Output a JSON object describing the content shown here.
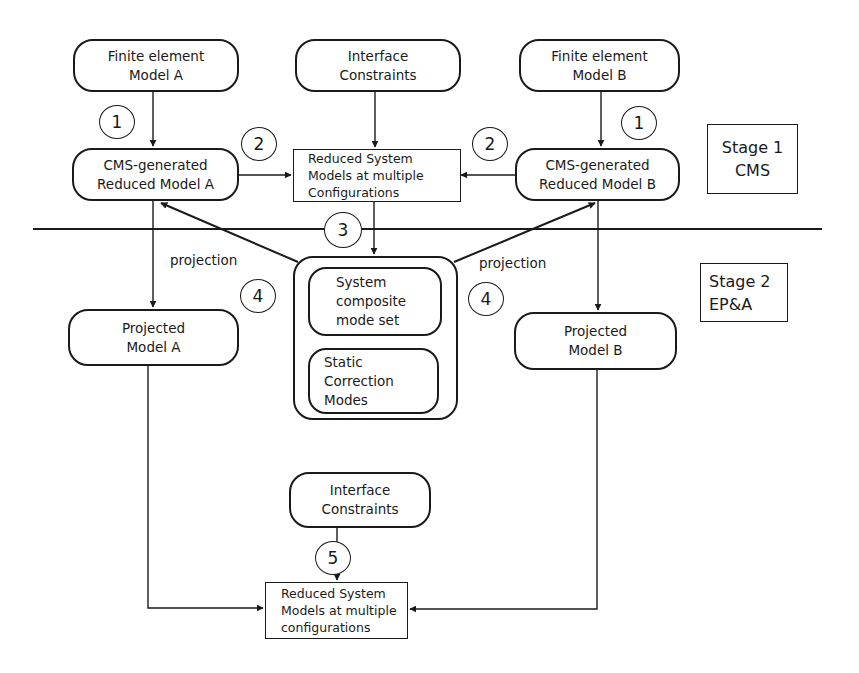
{
  "diagram": {
    "stages": [
      {
        "id": "stage1",
        "line1": "Stage 1",
        "line2": "CMS"
      },
      {
        "id": "stage2",
        "line1": "Stage 2",
        "line2": "EP&A"
      }
    ],
    "nodes": {
      "fe_model_a": {
        "line1": "Finite element",
        "line2": "Model A"
      },
      "interface_top": {
        "line1": "Interface",
        "line2": "Constraints"
      },
      "fe_model_b": {
        "line1": "Finite element",
        "line2": "Model B"
      },
      "cms_a": {
        "line1": "CMS-generated",
        "line2": "Reduced Model A"
      },
      "rsm_top": {
        "line1": "Reduced System",
        "line2": "Models at multiple",
        "line3": "Configurations"
      },
      "cms_b": {
        "line1": "CMS-generated",
        "line2": "Reduced Model B"
      },
      "system_composite": {
        "line1": "System",
        "line2": "composite",
        "line3": "mode set"
      },
      "static_correction": {
        "line1": "Static",
        "line2": "Correction",
        "line3": "Modes"
      },
      "projected_a": {
        "line1": "Projected",
        "line2": "Model A"
      },
      "projected_b": {
        "line1": "Projected",
        "line2": "Model B"
      },
      "interface_bottom": {
        "line1": "Interface",
        "line2": "Constraints"
      },
      "rsm_bottom": {
        "line1": "Reduced System",
        "line2": "Models at multiple",
        "line3": "configurations"
      }
    },
    "step_markers": [
      {
        "id": "step1_left",
        "label": "1"
      },
      {
        "id": "step1_right",
        "label": "1"
      },
      {
        "id": "step2_left",
        "label": "2"
      },
      {
        "id": "step2_right",
        "label": "2"
      },
      {
        "id": "step3",
        "label": "3"
      },
      {
        "id": "step4_left",
        "label": "4"
      },
      {
        "id": "step4_right",
        "label": "4"
      },
      {
        "id": "step5",
        "label": "5"
      }
    ],
    "edge_labels": {
      "projection_left": "projection",
      "projection_right": "projection"
    },
    "colors": {
      "ink": "#1a1a1a",
      "background": "#ffffff"
    }
  }
}
